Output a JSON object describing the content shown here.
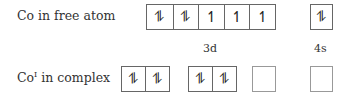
{
  "rows": [
    {
      "label": "Co in free atom",
      "label_sup": ""
    },
    {
      "label_main": "Co",
      "label_sup": "I",
      "label_rest": " in complex"
    }
  ],
  "free_atom": {
    "d3": [
      "⥮",
      "⥮",
      "↿",
      "↿",
      "↿"
    ],
    "s4": [
      "⥮"
    ],
    "d_label": "3d",
    "s_label": "4s"
  },
  "complex": {
    "group1": [
      "⥮",
      "⥮"
    ],
    "group2": [
      "⥮",
      "⥮"
    ],
    "group3": [
      ""
    ],
    "group4": [
      ""
    ]
  }
}
